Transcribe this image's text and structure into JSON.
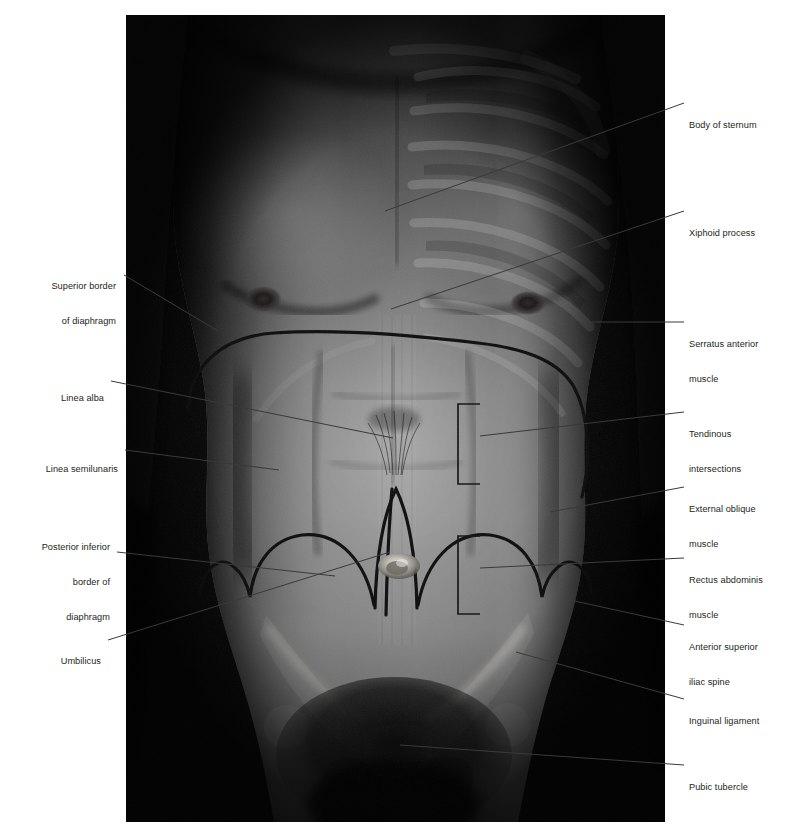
{
  "figure": {
    "kind": "anatomy-surface-projection-photo",
    "background_color": "#ffffff",
    "text_color": "#231f20",
    "leader_line_color": "#3a3a3a",
    "overlay_ink_color": "#101010"
  },
  "labels_left": [
    {
      "id": "superior-border-of-diaphragm",
      "lines": [
        "Superior border",
        "of diaphragm"
      ]
    },
    {
      "id": "linea-alba",
      "lines": [
        "Linea alba"
      ]
    },
    {
      "id": "linea-semilunaris",
      "lines": [
        "Linea semilunaris"
      ]
    },
    {
      "id": "posterior-inferior-border-of-diaphragm",
      "lines": [
        "Posterior inferior",
        "border of",
        "diaphragm"
      ]
    },
    {
      "id": "umbilicus",
      "lines": [
        "Umbilicus"
      ]
    }
  ],
  "labels_right": [
    {
      "id": "body-of-sternum",
      "lines": [
        "Body of sternum"
      ]
    },
    {
      "id": "xiphoid-process",
      "lines": [
        "Xiphoid process"
      ]
    },
    {
      "id": "serratus-anterior-muscle",
      "lines": [
        "Serratus anterior",
        "muscle"
      ]
    },
    {
      "id": "tendinous-intersections",
      "lines": [
        "Tendinous",
        "intersections"
      ]
    },
    {
      "id": "external-oblique-muscle",
      "lines": [
        "External oblique",
        "muscle"
      ]
    },
    {
      "id": "rectus-abdominis-muscle",
      "lines": [
        "Rectus abdominis",
        "muscle"
      ]
    },
    {
      "id": "anterior-superior-iliac-spine",
      "lines": [
        "Anterior superior",
        "iliac spine"
      ]
    },
    {
      "id": "inguinal-ligament",
      "lines": [
        "Inguinal ligament"
      ]
    },
    {
      "id": "pubic-tubercle",
      "lines": [
        "Pubic tubercle"
      ]
    }
  ],
  "label_text": {
    "superior_border_of_diaphragm_l1": "Superior border",
    "superior_border_of_diaphragm_l2": "of diaphragm",
    "linea_alba": "Linea alba",
    "linea_semilunaris": "Linea semilunaris",
    "posterior_inferior_l1": "Posterior inferior",
    "posterior_inferior_l2": "border of",
    "posterior_inferior_l3": "diaphragm",
    "umbilicus": "Umbilicus",
    "body_of_sternum": "Body of sternum",
    "xiphoid_process": "Xiphoid process",
    "serratus_anterior_l1": "Serratus anterior",
    "serratus_anterior_l2": "muscle",
    "tendinous_l1": "Tendinous",
    "tendinous_l2": "intersections",
    "external_oblique_l1": "External oblique",
    "external_oblique_l2": "muscle",
    "rectus_abdominis_l1": "Rectus abdominis",
    "rectus_abdominis_l2": "muscle",
    "asis_l1": "Anterior superior",
    "asis_l2": "iliac spine",
    "inguinal_ligament": "Inguinal ligament",
    "pubic_tubercle": "Pubic tubercle"
  }
}
